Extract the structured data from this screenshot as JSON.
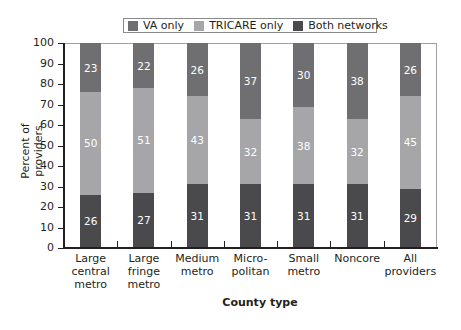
{
  "chart_data": {
    "type": "bar",
    "stacked": true,
    "title": "",
    "xlabel": "County type",
    "ylabel": "Percent of providers",
    "ylim": [
      0,
      100
    ],
    "yticks": [
      0,
      10,
      20,
      30,
      40,
      50,
      60,
      70,
      80,
      90,
      100
    ],
    "grid": false,
    "legend_position": "top",
    "categories": [
      "Large central metro",
      "Large fringe metro",
      "Medium metro",
      "Micro-politan",
      "Small metro",
      "Noncore",
      "All providers"
    ],
    "category_lines": [
      [
        "Large",
        "central",
        "metro"
      ],
      [
        "Large",
        "fringe",
        "metro"
      ],
      [
        "Medium",
        "metro"
      ],
      [
        "Micro-",
        "politan"
      ],
      [
        "Small",
        "metro"
      ],
      [
        "Noncore"
      ],
      [
        "All",
        "providers"
      ]
    ],
    "series": [
      {
        "name": "Both networks",
        "color": "#4a4a4c",
        "values": [
          26,
          27,
          31,
          31,
          31,
          31,
          29
        ]
      },
      {
        "name": "TRICARE only",
        "color": "#a6a6a8",
        "values": [
          50,
          51,
          43,
          32,
          38,
          32,
          45
        ]
      },
      {
        "name": "VA only",
        "color": "#6f6f72",
        "values": [
          23,
          22,
          26,
          37,
          30,
          38,
          26
        ]
      }
    ],
    "legend": [
      {
        "label": "VA only",
        "color": "#6f6f72"
      },
      {
        "label": "TRICARE only",
        "color": "#a6a6a8"
      },
      {
        "label": "Both networks",
        "color": "#4a4a4c"
      }
    ]
  }
}
